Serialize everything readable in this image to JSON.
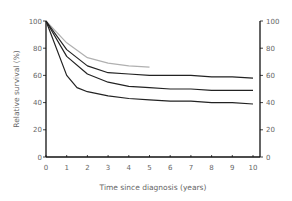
{
  "chart_data": {
    "type": "line",
    "title": "",
    "xlabel": "Time since diagnosis (years)",
    "ylabel": "Relative survival (%)",
    "xlim": [
      0,
      10
    ],
    "ylim": [
      0,
      100
    ],
    "x_ticks": [
      "0",
      "1",
      "2",
      "3",
      "4",
      "5",
      "6",
      "7",
      "8",
      "9",
      "10"
    ],
    "y_ticks": [
      "0",
      "20",
      "40",
      "60",
      "80",
      "100"
    ],
    "right_y_ticks": [
      "0",
      "20",
      "40",
      "60",
      "80",
      "100"
    ],
    "grid": false,
    "legend": null,
    "series": [
      {
        "name": "curve-grey",
        "color": "#b0b0b0",
        "x": [
          0,
          1,
          2,
          3,
          4,
          5
        ],
        "y": [
          100,
          84,
          73,
          69,
          67,
          66
        ]
      },
      {
        "name": "curve-1",
        "color": "#222222",
        "x": [
          0,
          1,
          2,
          3,
          4,
          5,
          6,
          7,
          8,
          9,
          10
        ],
        "y": [
          100,
          79,
          67,
          62,
          61,
          60,
          60,
          60,
          59,
          59,
          58
        ]
      },
      {
        "name": "curve-2",
        "color": "#222222",
        "x": [
          0,
          1,
          2,
          3,
          4,
          5,
          6,
          7,
          8,
          9,
          10
        ],
        "y": [
          100,
          74,
          61,
          55,
          52,
          51,
          50,
          50,
          49,
          49,
          49
        ]
      },
      {
        "name": "curve-3",
        "color": "#222222",
        "x": [
          0,
          1,
          1.5,
          2,
          3,
          4,
          5,
          6,
          7,
          8,
          9,
          10
        ],
        "y": [
          100,
          60,
          51,
          48,
          45,
          43,
          42,
          41,
          41,
          40,
          40,
          39
        ]
      }
    ]
  }
}
